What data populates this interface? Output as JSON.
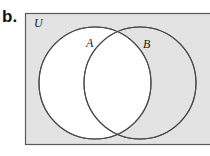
{
  "figure": {
    "part_label": "b.",
    "type": "venn-diagram"
  },
  "diagram": {
    "universe": {
      "label": "U",
      "fill_color": "#e3e3e3",
      "border_color": "#4d4d4d",
      "x": 25,
      "y": 13,
      "width": 190,
      "height": 132,
      "label_x": 34,
      "label_y": 27
    },
    "sets": [
      {
        "label": "A",
        "cx": 95,
        "cy": 83,
        "r": 56,
        "fill_color": "#ffffff",
        "stroke_color": "#4a4a4a",
        "label_x": 86,
        "label_y": 47
      },
      {
        "label": "B",
        "cx": 140,
        "cy": 83,
        "r": 56,
        "fill_color": "#ffffff",
        "stroke_color": "#4a4a4a",
        "label_x": 143,
        "label_y": 48
      }
    ]
  },
  "colors": {
    "page_background": "#ffffff",
    "universe_fill": "#e3e3e3",
    "circle_fill": "#ffffff",
    "line": "#4a4a4a",
    "text": "#121212"
  }
}
